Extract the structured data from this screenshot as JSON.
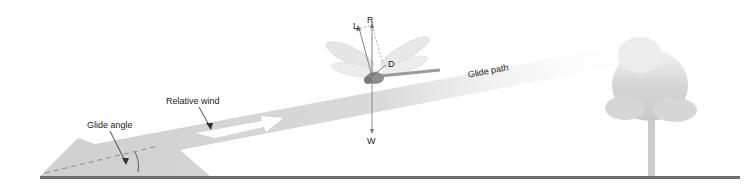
{
  "diagram": {
    "labels": {
      "relative_wind": "Relative wind",
      "glide_angle": "Glide angle",
      "glide_path": "Glide path"
    },
    "vectors": {
      "lift": "L",
      "resultant": "R",
      "drag": "D",
      "weight": "W"
    },
    "colors": {
      "band": "#d4d4d4",
      "ground": "#6e6e6e",
      "tree": "#cfcfcf",
      "text": "#222222"
    }
  }
}
